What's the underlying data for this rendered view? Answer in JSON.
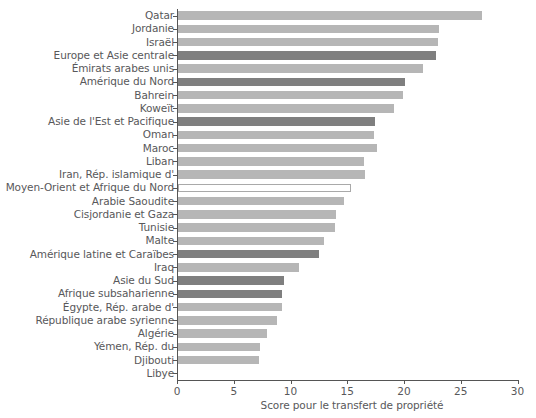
{
  "chart_data": {
    "type": "bar",
    "orientation": "horizontal",
    "title": "",
    "subtitle": "",
    "xlabel": "Score pour le transfert de propriété",
    "ylabel": "",
    "xlim": [
      0,
      30
    ],
    "xticks": [
      0,
      5,
      10,
      15,
      20,
      25,
      30
    ],
    "xtick_labels": [
      "0",
      "5",
      "10",
      "15",
      "20",
      "25",
      "30"
    ],
    "grid": false,
    "legend": false,
    "colors": {
      "country_bar": "#b6b6b6",
      "region_bar": "#7f7f7f",
      "highlight_bar": "#ffffff",
      "highlight_border": "#a9a9a9",
      "axis": "#555555",
      "text": "#58585a"
    },
    "categories": [
      "Qatar",
      "Jordanie",
      "Israël",
      "Europe et Asie centrale",
      "Émirats arabes unis",
      "Amérique du Nord",
      "Bahrein",
      "Koweït",
      "Asie de l'Est et Pacifique",
      "Oman",
      "Maroc",
      "Liban",
      "Iran, Rép. islamique d'",
      "Moyen-Orient et Afrique du Nord",
      "Arabie Saoudite",
      "Cisjordanie et Gaza",
      "Tunisie",
      "Malte",
      "Amérique latine et Caraïbes",
      "Iraq",
      "Asie du Sud",
      "Afrique subsaharienne",
      "Égypte, Rép. arabe d'",
      "République arabe syrienne",
      "Algérie",
      "Yémen, Rép. du",
      "Djibouti",
      "Libye"
    ],
    "values": [
      26.8,
      23.0,
      22.9,
      22.7,
      21.6,
      20.0,
      19.8,
      19.0,
      17.4,
      17.3,
      17.5,
      16.4,
      16.5,
      15.2,
      14.6,
      13.9,
      13.8,
      12.9,
      12.4,
      10.7,
      9.3,
      9.2,
      9.2,
      8.7,
      7.8,
      7.2,
      7.1,
      0
    ],
    "bar_styles": [
      "light",
      "light",
      "light",
      "dark",
      "light",
      "dark",
      "light",
      "light",
      "dark",
      "light",
      "light",
      "light",
      "light",
      "hollow",
      "light",
      "light",
      "light",
      "light",
      "dark",
      "light",
      "dark",
      "dark",
      "light",
      "light",
      "light",
      "light",
      "light",
      "zero"
    ]
  }
}
